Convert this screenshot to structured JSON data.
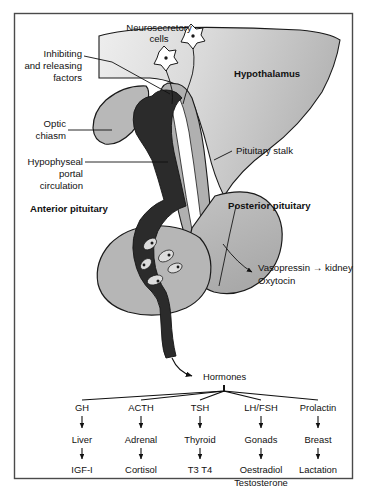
{
  "figure": {
    "frame": {
      "border_color": "#4a4a4a",
      "background": "#ffffff"
    }
  },
  "palette": {
    "hypothalamus_light": "#e2e2e2",
    "hypothalamus_dark": "#b9b9b9",
    "pituitary_gray": "#b3b3b3",
    "stalk_gray": "#b0b0b0",
    "portal_vessel_dark": "#2b2b2b",
    "cell_fill": "#dcdcdc",
    "outline": "#1a1a1a",
    "text": "#111111"
  },
  "anatomy_labels": {
    "neurosecretory_cells": {
      "line1": "Neurosecretory",
      "line2": "cells"
    },
    "inhibiting_factors": {
      "line1": "Inhibiting",
      "line2": "and releasing",
      "line3": "factors"
    },
    "optic_chiasm": {
      "line1": "Optic",
      "line2": "chiasm"
    },
    "hypophyseal_portal": {
      "line1": "Hypophyseal",
      "line2": "portal",
      "line3": "circulation"
    },
    "hypothalamus": "Hypothalamus",
    "pituitary_stalk": "Pituitary stalk",
    "anterior_pituitary": "Anterior pituitary",
    "posterior_pituitary": "Posterior pituitary",
    "posterior_output": {
      "line1": "Vasopressin → kidney",
      "line2": "Oxytocin"
    }
  },
  "cascade": {
    "root": "Hormones",
    "columns": [
      {
        "hormone": "GH",
        "target": "Liver",
        "effect": "IGF-I"
      },
      {
        "hormone": "ACTH",
        "target": "Adrenal",
        "effect": "Cortisol"
      },
      {
        "hormone": "TSH",
        "target": "Thyroid",
        "effect": "T3 T4"
      },
      {
        "hormone": "LH/FSH",
        "target": "Gonads",
        "effect": "Oestradiol",
        "effect2": "Testosterone"
      },
      {
        "hormone": "Prolactin",
        "target": "Breast",
        "effect": "Lactation"
      }
    ]
  }
}
